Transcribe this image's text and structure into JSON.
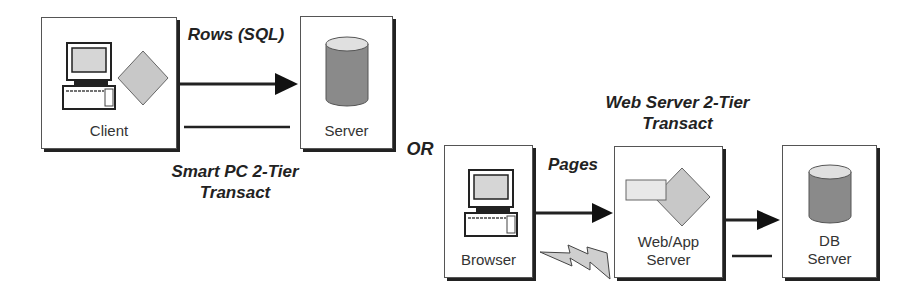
{
  "diagram": {
    "left": {
      "client_label": "Client",
      "server_label": "Server",
      "arrow_label": "Rows (SQL)",
      "caption_line1": "Smart PC 2-Tier",
      "caption_line2": "Transact"
    },
    "separator": "OR",
    "right": {
      "browser_label": "Browser",
      "webapp_label_line1": "Web/App",
      "webapp_label_line2": "Server",
      "db_label_line1": "DB",
      "db_label_line2": "Server",
      "arrow_label": "Pages",
      "caption_line1": "Web Server 2-Tier",
      "caption_line2": "Transact"
    },
    "colors": {
      "shape_fill": "#c8c8c8",
      "db_fill": "#8a8a8a",
      "screen_fill": "#d6d6d6",
      "line": "#222222"
    }
  }
}
